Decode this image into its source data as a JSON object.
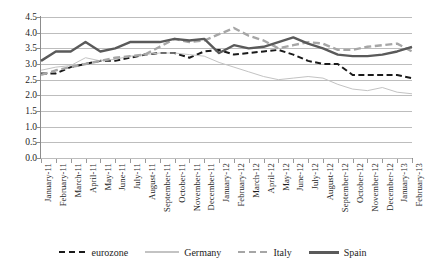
{
  "chart_data": {
    "type": "line",
    "title": "",
    "xlabel": "",
    "ylabel": "",
    "ylim": [
      0.0,
      4.5
    ],
    "ytick_step": 0.5,
    "grid": true,
    "legend_position": "bottom",
    "x": [
      "January-11",
      "February-11",
      "March-11",
      "April-11",
      "May-11",
      "June-11",
      "July-11",
      "August-11",
      "September-11",
      "October-11",
      "November-11",
      "December-11",
      "January-12",
      "February-12",
      "March-12",
      "April-12",
      "May-12",
      "June-12",
      "July-12",
      "August-12",
      "September-12",
      "October-12",
      "November-12",
      "December-12",
      "January-13",
      "February-13"
    ],
    "yticks": [
      "0.0",
      "0.5",
      "1.0",
      "1.5",
      "2.0",
      "2.5",
      "3.0",
      "3.5",
      "4.0",
      "4.5"
    ],
    "series": [
      {
        "name": "eurozone",
        "color": "#1a1a1a",
        "style": "dashed",
        "values": [
          2.7,
          2.7,
          2.9,
          3.0,
          3.1,
          3.1,
          3.2,
          3.3,
          3.35,
          3.35,
          3.2,
          3.4,
          3.45,
          3.3,
          3.35,
          3.4,
          3.45,
          3.3,
          3.1,
          3.0,
          3.0,
          2.65,
          2.65,
          2.65,
          2.65,
          2.55
        ]
      },
      {
        "name": "Germany",
        "color": "#c3c3c3",
        "style": "solid-thin",
        "values": [
          2.8,
          2.9,
          2.95,
          3.2,
          3.1,
          3.15,
          3.25,
          3.3,
          3.35,
          3.35,
          3.3,
          3.25,
          3.05,
          2.9,
          2.75,
          2.6,
          2.5,
          2.55,
          2.6,
          2.55,
          2.35,
          2.2,
          2.15,
          2.25,
          2.1,
          2.05
        ]
      },
      {
        "name": "Italy",
        "color": "#a6a6a6",
        "style": "dashed",
        "values": [
          2.65,
          2.8,
          2.9,
          3.0,
          3.1,
          3.2,
          3.25,
          3.3,
          3.55,
          3.8,
          3.7,
          3.75,
          3.95,
          4.15,
          3.9,
          3.75,
          3.5,
          3.6,
          3.7,
          3.65,
          3.45,
          3.45,
          3.55,
          3.6,
          3.65,
          3.4
        ]
      },
      {
        "name": "Spain",
        "color": "#5a5a5a",
        "style": "solid-thick",
        "values": [
          3.1,
          3.4,
          3.4,
          3.7,
          3.4,
          3.5,
          3.7,
          3.7,
          3.7,
          3.8,
          3.75,
          3.8,
          3.35,
          3.6,
          3.5,
          3.55,
          3.7,
          3.85,
          3.65,
          3.5,
          3.3,
          3.25,
          3.25,
          3.3,
          3.4,
          3.55
        ]
      }
    ]
  },
  "legend": {
    "items": [
      {
        "label": "eurozone"
      },
      {
        "label": "Germany"
      },
      {
        "label": "Italy"
      },
      {
        "label": "Spain"
      }
    ]
  }
}
